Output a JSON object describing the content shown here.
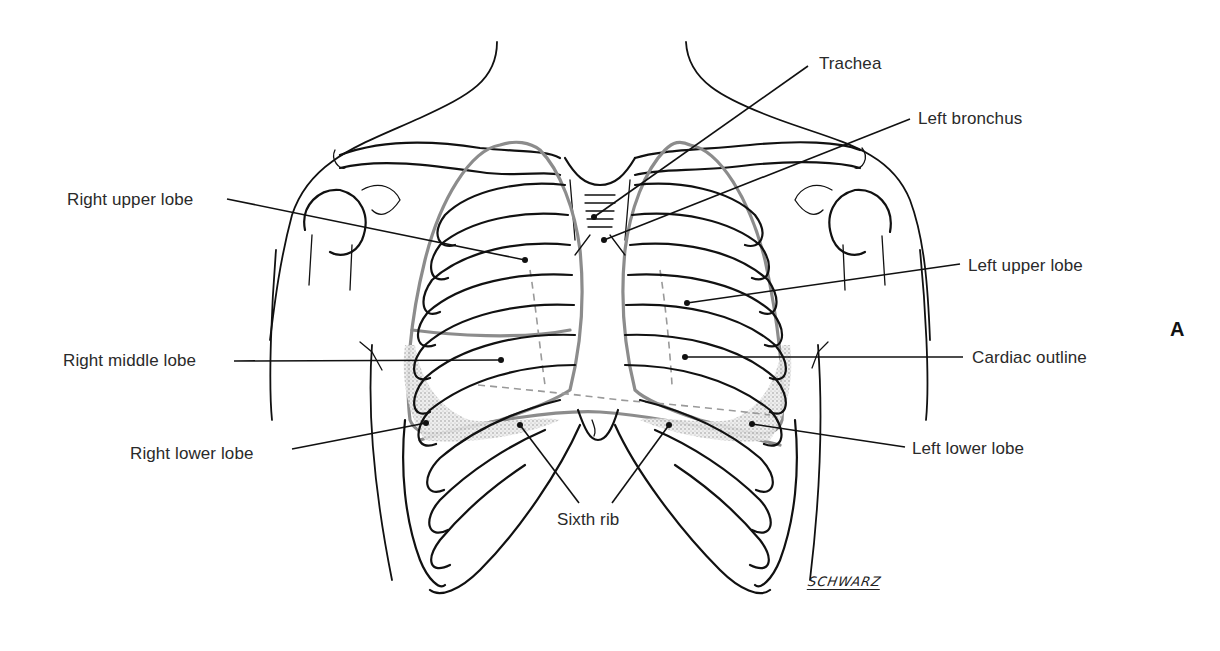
{
  "figure": {
    "panel_letter": "A",
    "signature": "SCHWARZ",
    "colors": {
      "bone_outline": "#111111",
      "lung_outline": "#8c8c8c",
      "label_text": "#2a2a2a",
      "background": "#ffffff"
    }
  },
  "labels": {
    "trachea": "Trachea",
    "left_bronchus": "Left bronchus",
    "right_upper_lobe": "Right upper lobe",
    "left_upper_lobe": "Left upper lobe",
    "right_middle_lobe": "Right middle lobe",
    "cardiac_outline": "Cardiac outline",
    "right_lower_lobe": "Right lower lobe",
    "left_lower_lobe": "Left lower lobe",
    "sixth_rib": "Sixth rib"
  }
}
